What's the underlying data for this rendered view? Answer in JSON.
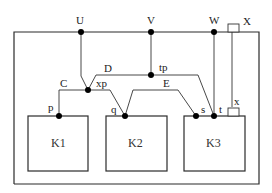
{
  "diagram": {
    "frame_labels": {
      "U": "U",
      "V": "V",
      "W": "W",
      "X": "X"
    },
    "wire_labels": {
      "C": "C",
      "D": "D",
      "E": "E"
    },
    "node_labels": {
      "xp": "xp",
      "tp": "tp",
      "p": "p",
      "q": "q",
      "s": "s",
      "t": "t",
      "x": "x"
    },
    "blocks": [
      {
        "id": "K1",
        "label": "K1"
      },
      {
        "id": "K2",
        "label": "K2"
      },
      {
        "id": "K3",
        "label": "K3"
      }
    ],
    "colors": {
      "line": "#2b2b2b",
      "node": "#000000",
      "background": "#ffffff"
    }
  }
}
